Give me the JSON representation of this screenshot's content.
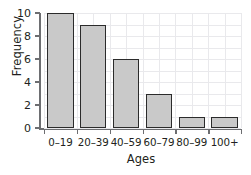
{
  "chart_data": {
    "type": "bar",
    "title": "",
    "xlabel": "Ages",
    "ylabel": "Frequency",
    "categories": [
      "0–19",
      "20–39",
      "40–59",
      "60–79",
      "80–99",
      "100+"
    ],
    "values": [
      10,
      9,
      6,
      3,
      1,
      1
    ],
    "ylim": [
      0,
      10
    ],
    "yticks": [
      0,
      2,
      4,
      6,
      8,
      10
    ],
    "ytick_labels": [
      "0",
      "2",
      "4",
      "6",
      "8",
      "10"
    ],
    "grid": true,
    "legend": null,
    "colors": {
      "bar_fill": "#c9c9c9",
      "bar_border": "#2b2b2b",
      "axis": "#6d6e71",
      "grid": "#e9e9ec",
      "text": "#231f20",
      "background": "#ffffff"
    }
  }
}
